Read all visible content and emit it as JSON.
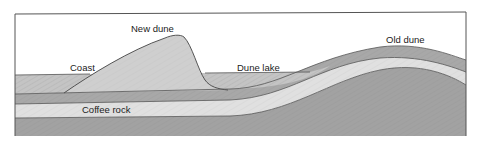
{
  "diagram": {
    "type": "geological cross-section",
    "labels": {
      "coast": "Coast",
      "new_dune": "New dune",
      "dune_lake": "Dune lake",
      "old_dune": "Old dune",
      "coffee_rock": "Coffee rock"
    },
    "colors": {
      "frame": "#555555",
      "sand_light": "#d2d2d2",
      "sand_mid": "#b4b4b4",
      "sand_dark": "#9a9a9a",
      "band_light": "#e2e2e2",
      "outline": "#444444",
      "background": "#ffffff"
    },
    "layers": [
      {
        "name": "surface sand",
        "shade": "mid"
      },
      {
        "name": "upper dark band",
        "shade": "dark"
      },
      {
        "name": "coffee rock",
        "shade": "light"
      },
      {
        "name": "base sediment",
        "shade": "dark"
      }
    ]
  }
}
